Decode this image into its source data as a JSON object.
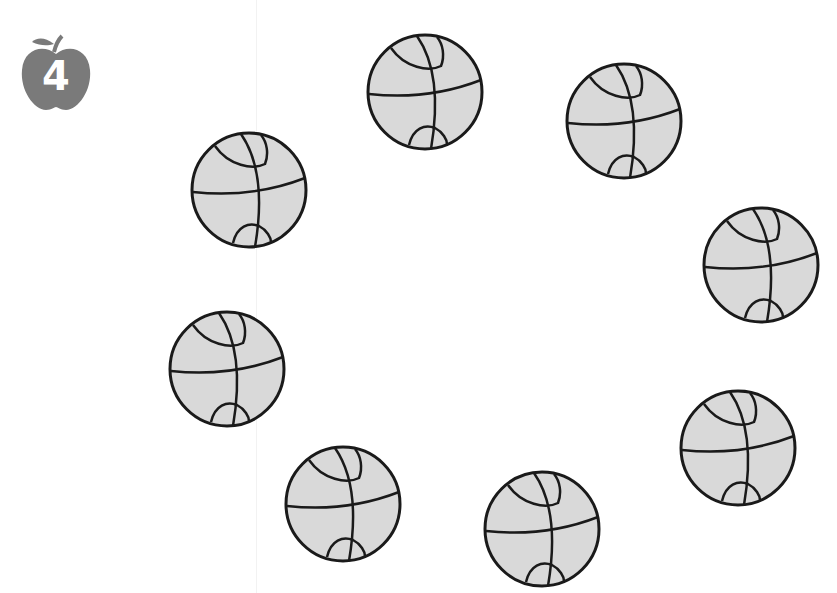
{
  "badge": {
    "icon": "apple-icon",
    "number": "4",
    "color": "#7a7a7a"
  },
  "ball_style": {
    "fill": "#d9d9d9",
    "stroke": "#1a1a1a"
  },
  "balls": [
    {
      "icon": "basketball-icon",
      "cx": 425,
      "cy": 92
    },
    {
      "icon": "basketball-icon",
      "cx": 624,
      "cy": 121
    },
    {
      "icon": "basketball-icon",
      "cx": 249,
      "cy": 190
    },
    {
      "icon": "basketball-icon",
      "cx": 761,
      "cy": 265
    },
    {
      "icon": "basketball-icon",
      "cx": 227,
      "cy": 369
    },
    {
      "icon": "basketball-icon",
      "cx": 738,
      "cy": 448
    },
    {
      "icon": "basketball-icon",
      "cx": 343,
      "cy": 504
    },
    {
      "icon": "basketball-icon",
      "cx": 542,
      "cy": 529
    }
  ],
  "count": 8
}
